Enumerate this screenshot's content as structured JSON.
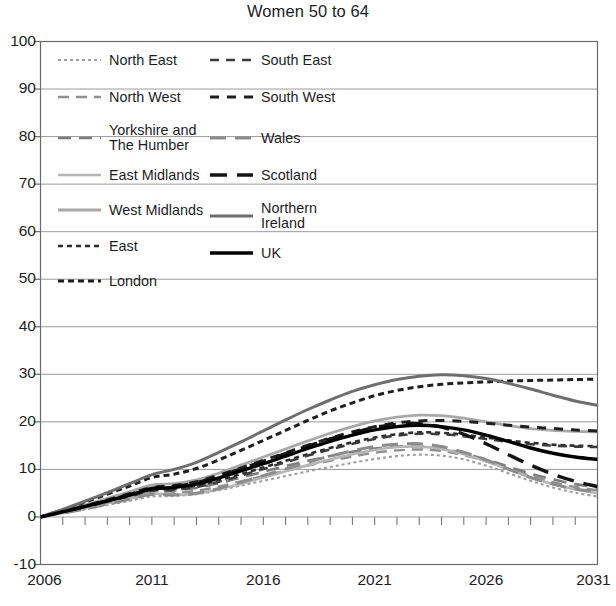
{
  "chart_data": {
    "type": "line",
    "title": "Women 50 to 64",
    "xlabel": "",
    "ylabel": "",
    "xlim": [
      2006,
      2031
    ],
    "ylim": [
      -10,
      100
    ],
    "ytick_labels": [
      "100",
      "90",
      "80",
      "70",
      "60",
      "50",
      "40",
      "30",
      "20",
      "10",
      "0",
      "-10"
    ],
    "yticks": [
      100,
      90,
      80,
      70,
      60,
      50,
      40,
      30,
      20,
      10,
      0,
      -10
    ],
    "xtick_labels": [
      "2006",
      "2011",
      "2016",
      "2021",
      "2026",
      "2031"
    ],
    "xticks": [
      2006,
      2011,
      2016,
      2021,
      2026,
      2031
    ],
    "minor_xticks_every": 1,
    "grid": "horizontal",
    "legend_position": "upper-left-inside",
    "x": [
      2006,
      2007,
      2008,
      2009,
      2010,
      2011,
      2012,
      2013,
      2014,
      2015,
      2016,
      2017,
      2018,
      2019,
      2020,
      2021,
      2022,
      2023,
      2024,
      2025,
      2026,
      2027,
      2028,
      2029,
      2030,
      2031
    ],
    "series": [
      {
        "name": "North East",
        "color": "#9e9e9e",
        "dash": "3,3",
        "width": 2.1,
        "values": [
          0,
          0.8,
          1.6,
          2.5,
          3.4,
          4.3,
          4.4,
          4.8,
          5.6,
          6.6,
          7.6,
          8.6,
          9.6,
          10.5,
          11.4,
          12.2,
          12.8,
          13.1,
          12.9,
          12.1,
          10.8,
          9.2,
          7.6,
          6.2,
          5.1,
          4.3
        ]
      },
      {
        "name": "North West",
        "color": "#8f8f8f",
        "dash": "11,7",
        "width": 2.4,
        "values": [
          0,
          0.9,
          1.8,
          2.8,
          3.8,
          4.8,
          5.0,
          5.5,
          6.4,
          7.5,
          8.6,
          9.7,
          10.8,
          11.8,
          12.7,
          13.5,
          14.0,
          14.2,
          13.9,
          13.0,
          11.7,
          10.1,
          8.6,
          7.3,
          6.3,
          5.6
        ]
      },
      {
        "name": "Yorkshire and\nThe Humber",
        "color": "#7d7d7d",
        "dash": "13,8",
        "width": 2.6,
        "values": [
          0,
          1.0,
          2.0,
          3.1,
          4.2,
          5.3,
          5.6,
          6.1,
          7.1,
          8.3,
          9.5,
          10.7,
          11.8,
          12.8,
          13.7,
          14.4,
          14.8,
          14.8,
          14.3,
          13.4,
          12.1,
          10.6,
          9.1,
          7.9,
          6.9,
          6.2
        ]
      },
      {
        "name": "East Midlands",
        "color": "#b5b5b5",
        "dash": "none",
        "width": 2.6,
        "values": [
          0,
          0.9,
          1.9,
          2.9,
          3.9,
          4.9,
          4.7,
          4.9,
          5.8,
          7.0,
          8.3,
          9.6,
          10.9,
          12.1,
          13.2,
          14.1,
          14.7,
          14.8,
          14.3,
          13.2,
          11.7,
          10.0,
          8.3,
          6.9,
          5.8,
          5.0
        ]
      },
      {
        "name": "West Midlands",
        "color": "#a8a8a8",
        "dash": "none",
        "width": 2.8,
        "values": [
          0,
          1.2,
          2.5,
          3.9,
          5.3,
          6.7,
          7.0,
          7.8,
          9.2,
          10.9,
          12.6,
          14.3,
          16.0,
          17.6,
          19.0,
          20.2,
          21.0,
          21.4,
          21.3,
          20.8,
          20.0,
          19.2,
          18.6,
          18.2,
          18.0,
          17.9
        ]
      },
      {
        "name": "East",
        "color": "#2b2b2b",
        "dash": "5,4",
        "width": 2.6,
        "values": [
          0,
          1.1,
          2.2,
          3.4,
          4.6,
          5.8,
          6.0,
          6.6,
          7.7,
          9.0,
          10.4,
          11.8,
          13.2,
          14.5,
          15.7,
          16.7,
          17.4,
          17.8,
          17.7,
          17.3,
          16.7,
          16.1,
          15.6,
          15.2,
          15.0,
          14.9
        ]
      },
      {
        "name": "London",
        "color": "#1f1f1f",
        "dash": "6,4",
        "width": 3.0,
        "values": [
          0,
          1.5,
          3.1,
          4.8,
          6.5,
          8.3,
          9.0,
          10.2,
          12.0,
          14.0,
          16.1,
          18.2,
          20.3,
          22.3,
          24.0,
          25.5,
          26.6,
          27.4,
          27.9,
          28.2,
          28.4,
          28.6,
          28.7,
          28.8,
          28.9,
          29.0
        ]
      },
      {
        "name": "South East",
        "color": "#3a3a3a",
        "dash": "9,7",
        "width": 2.6,
        "values": [
          0,
          1.0,
          2.1,
          3.2,
          4.3,
          5.5,
          5.7,
          6.3,
          7.4,
          8.7,
          10.1,
          11.5,
          12.9,
          14.2,
          15.4,
          16.4,
          17.1,
          17.5,
          17.4,
          17.0,
          16.4,
          15.8,
          15.3,
          15.0,
          14.8,
          14.7
        ]
      },
      {
        "name": "South West",
        "color": "#1f1f1f",
        "dash": "9,8",
        "width": 3.0,
        "values": [
          0,
          1.1,
          2.3,
          3.6,
          4.9,
          6.2,
          6.6,
          7.4,
          8.8,
          10.3,
          11.9,
          13.5,
          15.1,
          16.6,
          17.9,
          19.0,
          19.8,
          20.2,
          20.3,
          20.1,
          19.7,
          19.3,
          18.9,
          18.6,
          18.3,
          18.1
        ]
      },
      {
        "name": "Wales",
        "color": "#8c8c8c",
        "dash": "16,9",
        "width": 3.0,
        "values": [
          0,
          0.8,
          1.7,
          2.7,
          3.7,
          4.7,
          4.6,
          5.0,
          6.0,
          7.3,
          8.7,
          10.1,
          11.5,
          12.8,
          13.9,
          14.8,
          15.3,
          15.4,
          14.8,
          13.6,
          12.0,
          10.1,
          8.3,
          6.9,
          5.9,
          5.3
        ]
      },
      {
        "name": "Scotland",
        "color": "#141414",
        "dash": "17,10",
        "width": 3.4,
        "values": [
          0,
          1.1,
          2.2,
          3.4,
          4.7,
          6.0,
          6.4,
          7.2,
          8.6,
          10.1,
          11.7,
          13.3,
          14.9,
          16.4,
          17.7,
          18.8,
          19.5,
          19.6,
          18.9,
          17.4,
          15.4,
          13.1,
          10.9,
          9.0,
          7.5,
          6.4
        ]
      },
      {
        "name": "Northern Ireland",
        "color": "#6e6e6e",
        "dash": "none",
        "width": 3.0,
        "values": [
          0,
          1.6,
          3.3,
          5.1,
          7.0,
          8.9,
          10.0,
          11.5,
          13.6,
          15.8,
          18.1,
          20.4,
          22.6,
          24.6,
          26.4,
          27.8,
          28.9,
          29.6,
          29.9,
          29.7,
          29.1,
          28.1,
          26.9,
          25.6,
          24.4,
          23.5
        ]
      },
      {
        "name": "UK",
        "color": "#000000",
        "dash": "none",
        "width": 3.4,
        "values": [
          0,
          1.1,
          2.2,
          3.4,
          4.6,
          5.9,
          6.2,
          6.9,
          8.2,
          9.7,
          11.2,
          12.8,
          14.4,
          15.9,
          17.2,
          18.3,
          19.0,
          19.3,
          19.0,
          18.3,
          17.2,
          15.9,
          14.5,
          13.4,
          12.6,
          12.1
        ]
      }
    ]
  },
  "legend": {
    "left_column": [
      {
        "label": "North East",
        "series": "North East"
      },
      {
        "label": "North West",
        "series": "North West"
      },
      {
        "label": "Yorkshire and\nThe Humber",
        "series": "Yorkshire and The Humber"
      },
      {
        "label": "East Midlands",
        "series": "East Midlands"
      },
      {
        "label": "West Midlands",
        "series": "West Midlands"
      },
      {
        "label": "East",
        "series": "East"
      },
      {
        "label": "London",
        "series": "London"
      }
    ],
    "right_column": [
      {
        "label": "South East",
        "series": "South East"
      },
      {
        "label": "South West",
        "series": "South West"
      },
      {
        "label": "Wales",
        "series": "Wales"
      },
      {
        "label": "Scotland",
        "series": "Scotland"
      },
      {
        "label": "Northern\nIreland",
        "series": "Northern Ireland"
      },
      {
        "label": "UK",
        "series": "UK"
      }
    ]
  },
  "style": {
    "axis_color": "#6b6b6b",
    "grid_color": "#9a9a9a",
    "text_color": "#1d1d1d",
    "background": "#ffffff"
  }
}
